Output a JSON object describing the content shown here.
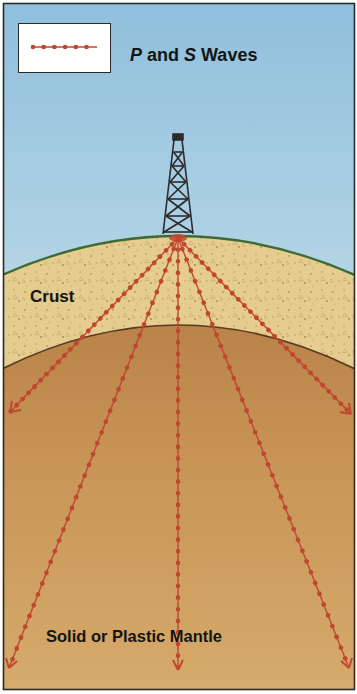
{
  "legend": {
    "label_p": "P",
    "label_and": " and ",
    "label_s": "S",
    "label_waves": " Waves",
    "symbol": "dotted-red-line",
    "color": "#c0472f"
  },
  "layers": {
    "crust_label": "Crust",
    "mantle_label": "Solid or Plastic Mantle"
  },
  "colors": {
    "sky_top": "#8fbfdc",
    "sky_bottom": "#eef3f2",
    "surface_line": "#3f6a35",
    "crust": "#e4cd8e",
    "crust_speckle": "#b79a5a",
    "mantle_top": "#b98349",
    "mantle_bottom": "#d6ab6c",
    "boundary": "#5a3a20",
    "wave": "#c0472f",
    "derrick": "#2b2b2b",
    "frame": "#2a2a2a"
  },
  "derrick": {
    "name": "oil-derrick",
    "base_x": 178,
    "base_y": 236
  },
  "rays": [
    {
      "name": "ray-left-outer",
      "end_x": 9,
      "end_y": 414
    },
    {
      "name": "ray-left-inner",
      "end_x": 8,
      "end_y": 668
    },
    {
      "name": "ray-center",
      "end_x": 178,
      "end_y": 668
    },
    {
      "name": "ray-right-inner",
      "end_x": 349,
      "end_y": 668
    },
    {
      "name": "ray-right-outer",
      "end_x": 352,
      "end_y": 414
    }
  ]
}
